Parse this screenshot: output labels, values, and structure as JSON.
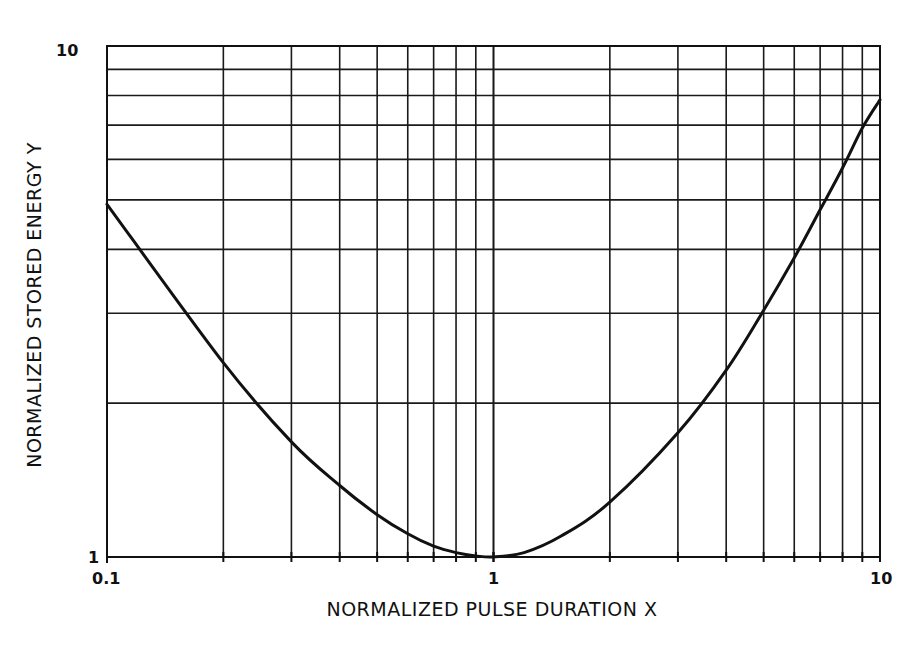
{
  "chart_data": {
    "type": "line",
    "title": "",
    "xlabel": "NORMALIZED PULSE DURATION X",
    "ylabel": "NORMALIZED STORED ENERGY Y",
    "xscale": "log",
    "yscale": "log",
    "xlim": [
      0.1,
      10
    ],
    "ylim": [
      1,
      10
    ],
    "grid": true,
    "legend": null,
    "x_tick_labels": [
      "0.1",
      "1",
      "10"
    ],
    "y_tick_labels": [
      "1",
      "10"
    ],
    "series": [
      {
        "name": "Y(X)",
        "x": [
          0.1,
          0.2,
          0.3,
          0.4,
          0.5,
          0.6,
          0.7,
          0.8,
          0.9,
          1.0,
          1.2,
          1.5,
          2,
          3,
          4,
          5,
          6,
          7,
          8,
          9,
          10
        ],
        "y": [
          4.9,
          2.4,
          1.68,
          1.38,
          1.21,
          1.11,
          1.05,
          1.02,
          1.005,
          1.0,
          1.02,
          1.1,
          1.28,
          1.75,
          2.32,
          3.04,
          3.85,
          4.78,
          5.77,
          6.91,
          7.85
        ]
      }
    ]
  },
  "axes": {
    "x_label": "NORMALIZED PULSE DURATION X",
    "y_label": "NORMALIZED STORED ENERGY Y",
    "x_ticks": [
      {
        "value": 0.1,
        "label": "0.1"
      },
      {
        "value": 1,
        "label": "1"
      },
      {
        "value": 10,
        "label": "10"
      }
    ],
    "y_ticks": [
      {
        "value": 1,
        "label": "1"
      },
      {
        "value": 10,
        "label": "10"
      }
    ]
  },
  "colors": {
    "line": "#111111",
    "grid": "#1a1a1a",
    "background": "#ffffff"
  }
}
